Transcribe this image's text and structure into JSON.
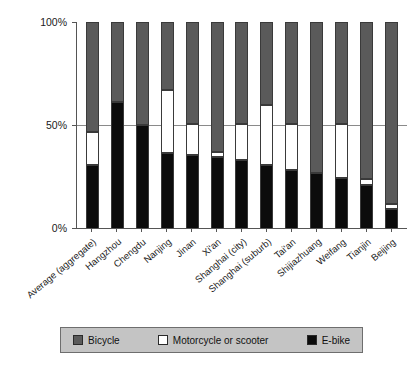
{
  "chart_data": {
    "type": "bar",
    "subtype": "stacked-100-percent",
    "title": "",
    "xlabel": "",
    "ylabel": "",
    "ylim": [
      0,
      100
    ],
    "ytick_labels": [
      "100%",
      "50%",
      "0%"
    ],
    "ytick_values": [
      100,
      50,
      0
    ],
    "grid": true,
    "legend_position": "bottom",
    "categories": [
      "Average (aggregate)",
      "Hangzhou",
      "Chengdu",
      "Nanjing",
      "Jinan",
      "Xi'an",
      "Shanghai (city)",
      "Shanghai (suburb)",
      "Tai'an",
      "Shijiazhuang",
      "Weifang",
      "Tianjin",
      "Beijing"
    ],
    "series": [
      {
        "name": "Bicycle",
        "color": "#5a5a5a",
        "values": [
          53.4,
          38.8,
          50.0,
          33.0,
          49.6,
          63.1,
          49.5,
          40.4,
          49.7,
          73.3,
          49.7,
          76.0,
          88.5
        ]
      },
      {
        "name": "Motorcycle or scooter",
        "color": "#ffffff",
        "values": [
          16.0,
          0.0,
          0.0,
          30.6,
          15.0,
          2.4,
          17.5,
          29.0,
          22.3,
          0.0,
          26.0,
          3.0,
          2.5
        ]
      },
      {
        "name": "E-bike",
        "color": "#0c0c0c",
        "values": [
          30.6,
          61.2,
          50.0,
          36.4,
          35.4,
          34.5,
          33.0,
          30.6,
          28.0,
          26.7,
          24.3,
          21.0,
          9.0
        ]
      }
    ]
  },
  "legend": {
    "items": [
      {
        "label": "Bicycle",
        "swatch": "bicycle-swatch"
      },
      {
        "label": "Motorcycle or scooter",
        "swatch": "motorcycle-swatch"
      },
      {
        "label": "E-bike",
        "swatch": "ebike-swatch"
      }
    ]
  },
  "axes": {
    "y_labels": [
      "100%",
      "50%",
      "0%"
    ]
  }
}
